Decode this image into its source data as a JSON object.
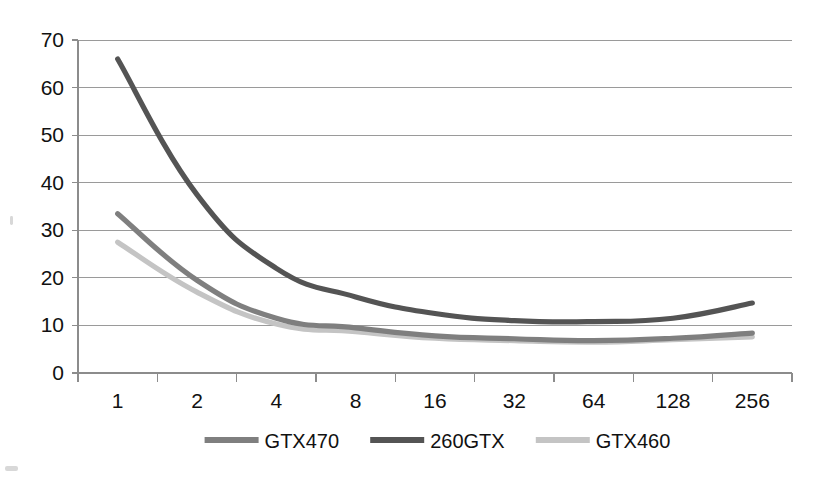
{
  "chart_data": {
    "type": "line",
    "title": "",
    "subtitle": "",
    "xlabel": "",
    "ylabel": "",
    "categories": [
      "1",
      "2",
      "4",
      "8",
      "16",
      "32",
      "64",
      "128",
      "256"
    ],
    "x_tick_labels": [
      "1",
      "2",
      "4",
      "8",
      "16",
      "32",
      "64",
      "128",
      "256"
    ],
    "y_tick_labels": [
      "0",
      "10",
      "20",
      "30",
      "40",
      "50",
      "60",
      "70"
    ],
    "y_ticks": [
      0,
      10,
      20,
      30,
      40,
      50,
      60,
      70
    ],
    "ylim": [
      0,
      70
    ],
    "grid": "horizontal",
    "legend_position": "bottom",
    "series": [
      {
        "name": "GTX470",
        "color": "#7f7f7f",
        "values": [
          33.5,
          19.5,
          11.5,
          9.5,
          7.8,
          7.2,
          6.8,
          7.3,
          8.4
        ]
      },
      {
        "name": "260GTX",
        "color": "#545454",
        "values": [
          66.0,
          37.5,
          22.0,
          16.0,
          12.5,
          11.0,
          10.8,
          11.5,
          14.7
        ]
      },
      {
        "name": "GTX460",
        "color": "#c4c4c4",
        "values": [
          27.5,
          17.0,
          10.3,
          8.7,
          7.3,
          6.8,
          6.5,
          7.0,
          7.6
        ]
      }
    ]
  },
  "legend": {
    "items": [
      {
        "label": "GTX470",
        "color": "#7f7f7f"
      },
      {
        "label": "260GTX",
        "color": "#545454"
      },
      {
        "label": "GTX460",
        "color": "#c4c4c4"
      }
    ]
  },
  "colors": {
    "background": "#ffffff",
    "gridline": "#9a9a9a",
    "axis": "#8c8c8c",
    "text": "#111111"
  }
}
